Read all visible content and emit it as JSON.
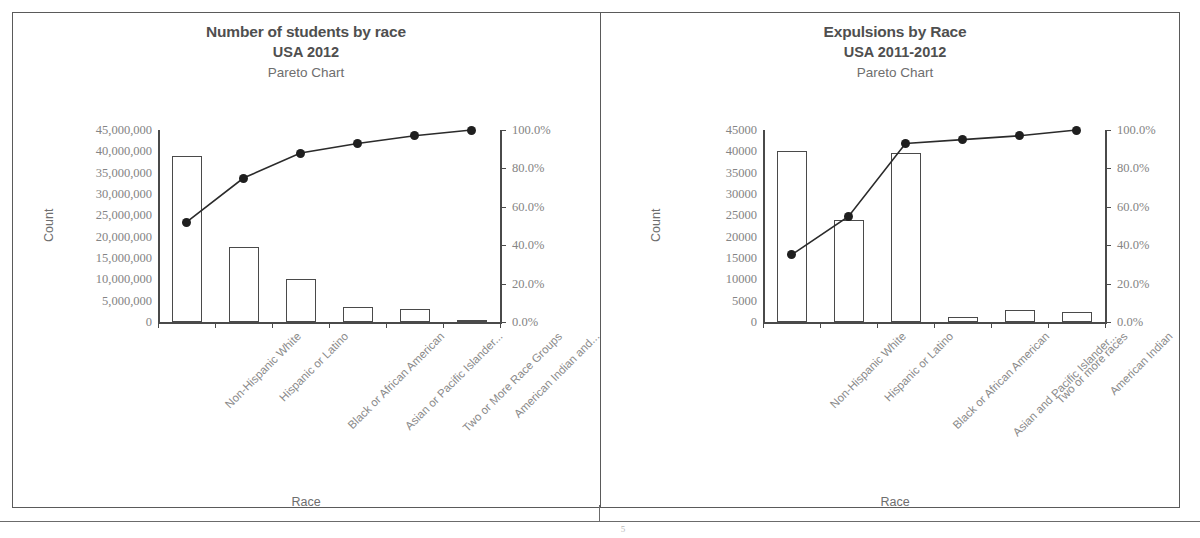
{
  "document": {
    "page_number": "5",
    "border_color": "#5a5a5a"
  },
  "panels": [
    {
      "id": "students-by-race",
      "title_line1": "Number of students by race",
      "title_line2": "USA 2012",
      "title_line3": "Pareto Chart",
      "y_axis_title": "Count",
      "x_axis_title": "Race",
      "y_tick_labels": [
        "45,000,000",
        "40,000,000",
        "35,000,000",
        "30,000,000",
        "25,000,000",
        "20,000,000",
        "15,000,000",
        "10,000,000",
        "5,000,000",
        "0"
      ],
      "y2_tick_labels": [
        "100.0%",
        "80.0%",
        "60.0%",
        "40.0%",
        "20.0%",
        "0.0%"
      ],
      "categories": [
        "Non-Hispanic White",
        "Hispanic or Latino",
        "Black or African American",
        "Asian or Pacific Islander...",
        "Two or More Race Groups",
        "American Indian and..."
      ]
    },
    {
      "id": "expulsions-by-race",
      "title_line1": "Expulsions by Race",
      "title_line2": "USA 2011-2012",
      "title_line3": "Pareto Chart",
      "y_axis_title": "Count",
      "x_axis_title": "Race",
      "y_tick_labels": [
        "45000",
        "40000",
        "35000",
        "30000",
        "25000",
        "20000",
        "15000",
        "10000",
        "5000",
        "0"
      ],
      "y2_tick_labels": [
        "100.0%",
        "80.0%",
        "60.0%",
        "40.0%",
        "20.0%",
        "0.0%"
      ],
      "categories": [
        "Non-Hispanic White",
        "Hispanic or Latino",
        "Black or African American",
        "Asian and Pacific Islander...",
        "Two or more races",
        "American Indian"
      ]
    }
  ],
  "chart_data": [
    {
      "type": "bar",
      "title": "Number of students by race USA 2012 Pareto Chart",
      "xlabel": "Race",
      "ylabel": "Count",
      "y2label": "",
      "categories": [
        "Non-Hispanic White",
        "Hispanic or Latino",
        "Black or African American",
        "Asian or Pacific Islander...",
        "Two or More Race Groups",
        "American Indian and..."
      ],
      "series": [
        {
          "name": "Count",
          "type": "bar",
          "values": [
            39000000,
            17500000,
            10000000,
            3600000,
            3100000,
            500000
          ]
        },
        {
          "name": "Cumulative %",
          "type": "line",
          "values": [
            52.0,
            75.0,
            88.0,
            93.0,
            97.0,
            100.0
          ]
        }
      ],
      "ylim": [
        0,
        45000000
      ],
      "y2lim": [
        0,
        100
      ],
      "yticks": [
        0,
        5000000,
        10000000,
        15000000,
        20000000,
        25000000,
        30000000,
        35000000,
        40000000,
        45000000
      ],
      "y2ticks": [
        0,
        20,
        40,
        60,
        80,
        100
      ],
      "grid": false,
      "legend": "none"
    },
    {
      "type": "bar",
      "title": "Expulsions by Race USA 2011-2012 Pareto Chart",
      "xlabel": "Race",
      "ylabel": "Count",
      "y2label": "",
      "categories": [
        "Non-Hispanic White",
        "Hispanic or Latino",
        "Black or African American",
        "Asian and Pacific Islander...",
        "Two or more races",
        "American Indian"
      ],
      "series": [
        {
          "name": "Count",
          "type": "bar",
          "values": [
            40000,
            24000,
            39500,
            1200,
            2700,
            2400
          ]
        },
        {
          "name": "Cumulative %",
          "type": "line",
          "values": [
            35.0,
            55.0,
            93.0,
            95.0,
            97.0,
            100.0
          ]
        }
      ],
      "ylim": [
        0,
        45000
      ],
      "y2lim": [
        0,
        100
      ],
      "yticks": [
        0,
        5000,
        10000,
        15000,
        20000,
        25000,
        30000,
        35000,
        40000,
        45000
      ],
      "y2ticks": [
        0,
        20,
        40,
        60,
        80,
        100
      ],
      "grid": false,
      "legend": "none"
    }
  ]
}
